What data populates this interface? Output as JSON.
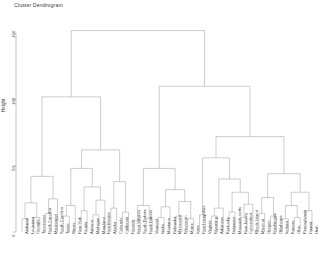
{
  "chart_data": {
    "type": "dendrogram",
    "title": "Cluster Dendrogram",
    "xlabel": "",
    "ylabel": "Height",
    "ylim": [
      0,
      160
    ],
    "yticks": [
      0,
      50,
      100,
      150
    ],
    "ytick_labels": [
      "0",
      "50",
      "100",
      "150"
    ],
    "grid": false,
    "legend": "none",
    "n_leaves": 50,
    "linkage": "complete",
    "line_color": "#9a9a9a",
    "leaf_labels": [
      "Alabama",
      "Louisiana",
      "Georgia",
      "Tennessee",
      "North Carolina",
      "Mississippi",
      "South Carolina",
      "Texas",
      "Illinois",
      "New York",
      "Florida",
      "Arizona",
      "Michigan",
      "Maryland",
      "New Mexico",
      "Alaska",
      "Colorado",
      "California",
      "Nevada",
      "West Virginia",
      "South Dakota",
      "North Dakota",
      "Vermont",
      "Idaho",
      "Montana",
      "Nebraska",
      "Minnesota",
      "Wisconsin",
      "Maine",
      "Iowa",
      "New Hampshire",
      "Virginia",
      "Wyoming",
      "Arkansas",
      "Kentucky",
      "Delaware",
      "Massachusetts",
      "New Jersey",
      "Connecticut",
      "Rhode Island",
      "Missouri",
      "Oregon",
      "Washington",
      "Oklahoma",
      "Indiana",
      "Kansas",
      "Ohio",
      "Pennsylvania",
      "Hawaii",
      "Utah"
    ],
    "merges": [
      {
        "id": "m1",
        "left": "Alabama",
        "right": "Louisiana",
        "height": 10
      },
      {
        "id": "m2",
        "left": "Georgia",
        "right": "Tennessee",
        "height": 11
      },
      {
        "id": "m3",
        "left": "m1",
        "right": "m2",
        "height": 22
      },
      {
        "id": "m4",
        "left": "North Carolina",
        "right": "Mississippi",
        "height": 14
      },
      {
        "id": "m5",
        "left": "m4",
        "right": "South Carolina",
        "height": 25
      },
      {
        "id": "m6",
        "left": "m3",
        "right": "m5",
        "height": 42
      },
      {
        "id": "m7",
        "left": "Texas",
        "right": "Illinois",
        "height": 12
      },
      {
        "id": "m8",
        "left": "m7",
        "right": "New York",
        "height": 20
      },
      {
        "id": "m9",
        "left": "Florida",
        "right": "Arizona",
        "height": 16
      },
      {
        "id": "m10",
        "left": "Michigan",
        "right": "Maryland",
        "height": 13
      },
      {
        "id": "m11",
        "left": "m10",
        "right": "New Mexico",
        "height": 24
      },
      {
        "id": "m12",
        "left": "m9",
        "right": "m11",
        "height": 34
      },
      {
        "id": "m13",
        "left": "m8",
        "right": "m12",
        "height": 48
      },
      {
        "id": "m14",
        "left": "Alaska",
        "right": "Colorado",
        "height": 18
      },
      {
        "id": "m15",
        "left": "California",
        "right": "Nevada",
        "height": 15
      },
      {
        "id": "m16",
        "left": "m14",
        "right": "m15",
        "height": 38
      },
      {
        "id": "m17",
        "left": "m13",
        "right": "m16",
        "height": 62
      },
      {
        "id": "m18",
        "left": "m6",
        "right": "m17",
        "height": 102
      },
      {
        "id": "m19",
        "left": "West Virginia",
        "right": "South Dakota",
        "height": 9
      },
      {
        "id": "m20",
        "left": "North Dakota",
        "right": "Vermont",
        "height": 10
      },
      {
        "id": "m21",
        "left": "m19",
        "right": "m20",
        "height": 20
      },
      {
        "id": "m22",
        "left": "Idaho",
        "right": "Montana",
        "height": 11
      },
      {
        "id": "m23",
        "left": "m22",
        "right": "Nebraska",
        "height": 19
      },
      {
        "id": "m24",
        "left": "Minnesota",
        "right": "Wisconsin",
        "height": 12
      },
      {
        "id": "m25",
        "left": "Maine",
        "right": "Iowa",
        "height": 10
      },
      {
        "id": "m26",
        "left": "m24",
        "right": "m25",
        "height": 23
      },
      {
        "id": "m27",
        "left": "m23",
        "right": "m26",
        "height": 32
      },
      {
        "id": "m28",
        "left": "m21",
        "right": "m27",
        "height": 48
      },
      {
        "id": "m29",
        "left": "New Hampshire",
        "right": "Virginia",
        "height": 13
      },
      {
        "id": "m30",
        "left": "Wyoming",
        "right": "Arkansas",
        "height": 12
      },
      {
        "id": "m31",
        "left": "m30",
        "right": "Kentucky",
        "height": 18
      },
      {
        "id": "m32",
        "left": "Delaware",
        "right": "Massachusetts",
        "height": 15
      },
      {
        "id": "m33",
        "left": "New Jersey",
        "right": "Connecticut",
        "height": 11
      },
      {
        "id": "m34",
        "left": "m33",
        "right": "Rhode Island",
        "height": 21
      },
      {
        "id": "m35",
        "left": "m32",
        "right": "m34",
        "height": 30
      },
      {
        "id": "m36",
        "left": "m31",
        "right": "m35",
        "height": 40
      },
      {
        "id": "m37",
        "left": "m29",
        "right": "m36",
        "height": 56
      },
      {
        "id": "m38",
        "left": "Missouri",
        "right": "Oregon",
        "height": 14
      },
      {
        "id": "m39",
        "left": "Washington",
        "right": "Oklahoma",
        "height": 12
      },
      {
        "id": "m40",
        "left": "m38",
        "right": "m39",
        "height": 26
      },
      {
        "id": "m41",
        "left": "Indiana",
        "right": "Kansas",
        "height": 10
      },
      {
        "id": "m42",
        "left": "Ohio",
        "right": "Pennsylvania",
        "height": 11
      },
      {
        "id": "m43",
        "left": "m41",
        "right": "m42",
        "height": 20
      },
      {
        "id": "m44",
        "left": "Hawaii",
        "right": "Utah",
        "height": 16
      },
      {
        "id": "m45",
        "left": "m43",
        "right": "m44",
        "height": 30
      },
      {
        "id": "m46",
        "left": "m40",
        "right": "m45",
        "height": 44
      },
      {
        "id": "m47",
        "left": "m37",
        "right": "m46",
        "height": 72
      },
      {
        "id": "m48",
        "left": "m28",
        "right": "m47",
        "height": 110
      },
      {
        "id": "m49",
        "left": "m18",
        "right": "m48",
        "height": 152
      }
    ]
  }
}
